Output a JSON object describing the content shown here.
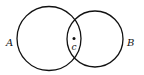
{
  "diagram": {
    "type": "venn",
    "circles": [
      {
        "label": "A",
        "cx": 49,
        "cy": 38,
        "r": 32
      },
      {
        "label": "B",
        "cx": 95,
        "cy": 39,
        "r": 28
      }
    ],
    "point": {
      "label": "c",
      "x": 74,
      "y": 38
    },
    "labels": {
      "a": "A",
      "b": "B",
      "c": "c"
    },
    "stroke_color": "#111111",
    "background": "#ffffff"
  }
}
